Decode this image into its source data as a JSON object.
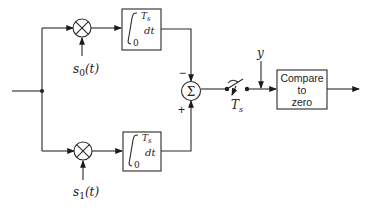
{
  "diagram": {
    "type": "block-diagram",
    "branches": [
      {
        "name": "upper",
        "multiplier_input": "s",
        "multiplier_input_sub": "0",
        "multiplier_input_arg": "(t)",
        "integrator": {
          "lower_limit": "0",
          "upper_limit": "T",
          "upper_limit_sub": "s",
          "differential": "dt"
        },
        "summer_sign": "−"
      },
      {
        "name": "lower",
        "multiplier_input": "s",
        "multiplier_input_sub": "1",
        "multiplier_input_arg": "(t)",
        "integrator": {
          "lower_limit": "0",
          "upper_limit": "T",
          "upper_limit_sub": "s",
          "differential": "dt"
        },
        "summer_sign": "+"
      }
    ],
    "summer": {
      "symbol": "Σ"
    },
    "multiplier_symbol": "⊗",
    "sampler": {
      "label": "T",
      "label_sub": "s"
    },
    "threshold_input": {
      "label": "y"
    },
    "decision": {
      "line1": "Compare",
      "line2": "to",
      "line3": "zero"
    },
    "icons": {
      "multiplier": "multiplier-icon",
      "integrator": "integral-icon",
      "summer": "summation-icon",
      "switch": "sampling-switch-icon"
    }
  }
}
